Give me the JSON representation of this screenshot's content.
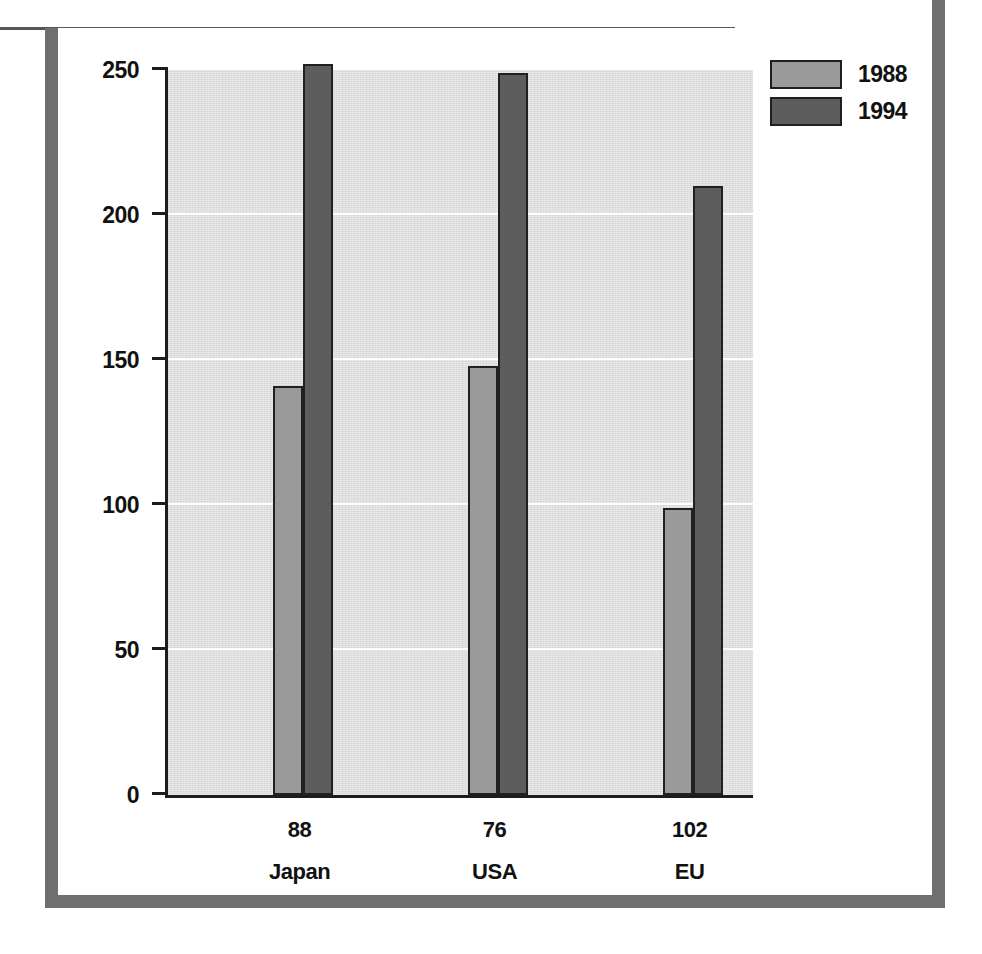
{
  "chart_data": {
    "type": "bar",
    "title": "",
    "subtitle": "",
    "xlabel": "",
    "ylabel": "",
    "categories": [
      "Japan",
      "USA",
      "EU"
    ],
    "category_values": [
      "88",
      "76",
      "102"
    ],
    "series": [
      {
        "name": "1988",
        "values": [
          141,
          148,
          99
        ],
        "color": "#9a9a9a"
      },
      {
        "name": "1994",
        "values": [
          252,
          249,
          210
        ],
        "color": "#5d5d5d"
      }
    ],
    "ylim": [
      0,
      250
    ],
    "yticks": [
      0,
      50,
      100,
      150,
      200,
      250
    ],
    "ytick_labels": [
      "0",
      "50",
      "100",
      "150",
      "200",
      "250"
    ],
    "grid": true,
    "gridlines_at": [
      50,
      100,
      150,
      200,
      250
    ],
    "legend_position": "top-right",
    "plot_background": "#dedede",
    "axis_color": "#1c1c1c",
    "bar_outline": "#202020",
    "frame_color": "#6f6f71",
    "rule_color": "#55555a"
  },
  "legend": {
    "items": [
      {
        "label": "1988",
        "swatch": "legend-swatch-1988"
      },
      {
        "label": "1994",
        "swatch": "legend-swatch-1994"
      }
    ]
  },
  "axis": {
    "y": {
      "ticks": [
        {
          "label": "250",
          "value": 250
        },
        {
          "label": "200",
          "value": 200
        },
        {
          "label": "150",
          "value": 150
        },
        {
          "label": "100",
          "value": 100
        },
        {
          "label": "50",
          "value": 50
        },
        {
          "label": "0",
          "value": 0
        }
      ]
    },
    "x": {
      "groups": [
        {
          "value": "88",
          "name": "Japan"
        },
        {
          "value": "76",
          "name": "USA"
        },
        {
          "value": "102",
          "name": "EU"
        }
      ]
    }
  }
}
